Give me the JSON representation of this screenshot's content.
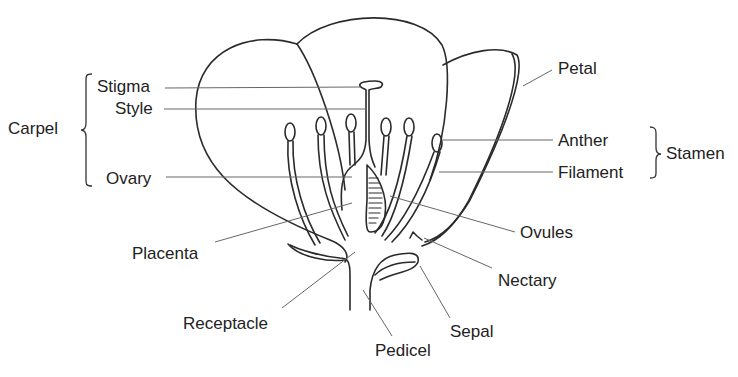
{
  "diagram": {
    "groups": {
      "carpel": "Carpel",
      "stamen": "Stamen"
    },
    "labels": {
      "stigma": "Stigma",
      "style": "Style",
      "ovary": "Ovary",
      "placenta": "Placenta",
      "receptacle": "Receptacle",
      "pedicel": "Pedicel",
      "sepal": "Sepal",
      "nectary": "Nectary",
      "ovules": "Ovules",
      "filament": "Filament",
      "anther": "Anther",
      "petal": "Petal"
    },
    "colors": {
      "line": "#2a2a2a",
      "leader": "#666666",
      "text": "#222222",
      "background": "#ffffff"
    }
  }
}
